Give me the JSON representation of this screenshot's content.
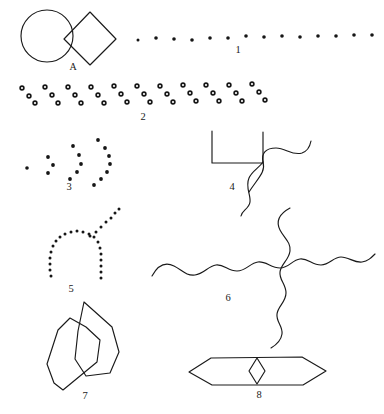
{
  "page": {
    "width": 384,
    "height": 414,
    "background_color": "#ffffff",
    "ink_color": "#1a1a1a"
  },
  "labels": {
    "A": "A",
    "one": "1",
    "two": "2",
    "three": "3",
    "four": "4",
    "five": "5",
    "six": "6",
    "seven": "7",
    "eight": "8"
  },
  "figures": [
    {
      "id": "A",
      "label": "A",
      "name": "circle-and-diamond",
      "description": "A circle overlapping a square rotated 45 degrees (diamond)",
      "label_position": {
        "x": 73,
        "y": 66
      }
    },
    {
      "id": "1",
      "label": "1",
      "name": "dot-row-filled",
      "description": "A horizontal row of evenly spaced small filled dots",
      "dot_count": 14,
      "dot_style": "filled",
      "label_position": {
        "x": 238,
        "y": 50
      }
    },
    {
      "id": "2",
      "label": "2",
      "name": "open-circle-zigzag-band",
      "description": "A broad band of small open circles arranged in a repeating zigzag of three vertical levels",
      "dot_count": 39,
      "dot_style": "open",
      "label_position": {
        "x": 143,
        "y": 117
      }
    },
    {
      "id": "3",
      "label": "3",
      "name": "nested-dot-arcs",
      "description": "Four nested right-opening arcs made of filled dots, increasing in size from left to right",
      "dot_style": "filled",
      "label_position": {
        "x": 69,
        "y": 186
      }
    },
    {
      "id": "4",
      "label": "4",
      "name": "open-square-with-wavy-line",
      "description": "An open-topped square outline crossed at its corner by a wavy line",
      "label_position": {
        "x": 232,
        "y": 186
      }
    },
    {
      "id": "5",
      "label": "5",
      "name": "dotted-arch-with-branch",
      "description": "A dotted inverted-U arch with a dotted diagonal branch rising to the upper right",
      "dot_style": "filled",
      "label_position": {
        "x": 71,
        "y": 288
      }
    },
    {
      "id": "6",
      "label": "6",
      "name": "crossing-wavy-lines",
      "description": "A long horizontal wavy line crossed by a long vertical wavy line",
      "label_position": {
        "x": 228,
        "y": 297
      }
    },
    {
      "id": "7",
      "label": "7",
      "name": "overlapping-polygons",
      "description": "Two overlapping irregular elongated polygons",
      "label_position": {
        "x": 85,
        "y": 395
      }
    },
    {
      "id": "8",
      "label": "8",
      "name": "elongated-hexagon-with-diamond",
      "description": "A long flat hexagon with a small vertical diamond at its centre",
      "label_position": {
        "x": 259,
        "y": 395
      }
    }
  ]
}
